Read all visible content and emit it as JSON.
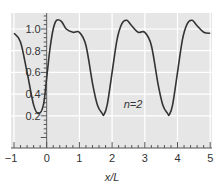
{
  "chart_data": {
    "type": "line",
    "title": "",
    "xlabel": "x/L",
    "ylabel": "",
    "xlim": [
      -1,
      5
    ],
    "ylim": [
      0.0,
      1.15
    ],
    "xticks": [
      "-1",
      "0",
      "1",
      "2",
      "3",
      "4",
      "5"
    ],
    "yticks": [
      "0.2",
      "0.4",
      "0.6",
      "0.8",
      "1.0"
    ],
    "grid": true,
    "annotations": [
      {
        "text": "n=2",
        "x": 2.6,
        "y": 0.35
      }
    ],
    "series": [
      {
        "name": "n=2",
        "x": [
          -1.0,
          -0.8,
          -0.6,
          -0.4,
          -0.25,
          -0.1,
          0.0,
          0.1,
          0.2,
          0.3,
          0.45,
          0.6,
          0.8,
          1.0,
          1.2,
          1.4,
          1.55,
          1.7,
          1.75,
          1.85,
          2.0,
          2.15,
          2.3,
          2.45,
          2.6,
          2.8,
          3.0,
          3.2,
          3.4,
          3.55,
          3.7,
          3.75,
          3.85,
          4.0,
          4.15,
          4.3,
          4.45,
          4.6,
          4.8,
          5.0
        ],
        "y": [
          0.96,
          0.88,
          0.6,
          0.3,
          0.22,
          0.3,
          0.55,
          0.82,
          1.0,
          1.08,
          1.07,
          1.0,
          0.97,
          0.97,
          0.85,
          0.5,
          0.3,
          0.22,
          0.21,
          0.3,
          0.6,
          0.9,
          1.05,
          1.08,
          1.03,
          0.97,
          0.97,
          0.85,
          0.5,
          0.3,
          0.22,
          0.21,
          0.3,
          0.6,
          0.9,
          1.05,
          1.08,
          1.03,
          0.97,
          0.96
        ]
      }
    ]
  },
  "labels": {
    "xlabel": "x/L",
    "annotation": "n=2",
    "xticks": [
      "−1",
      "0",
      "1",
      "2",
      "3",
      "4",
      "5"
    ],
    "yticks": [
      "0.2",
      "0.4",
      "0.6",
      "0.8",
      "1.0"
    ]
  },
  "colors": {
    "plot_bg": "#e6e6e6",
    "grid": "#ffffff",
    "line": "#333333",
    "axis": "#555555"
  }
}
